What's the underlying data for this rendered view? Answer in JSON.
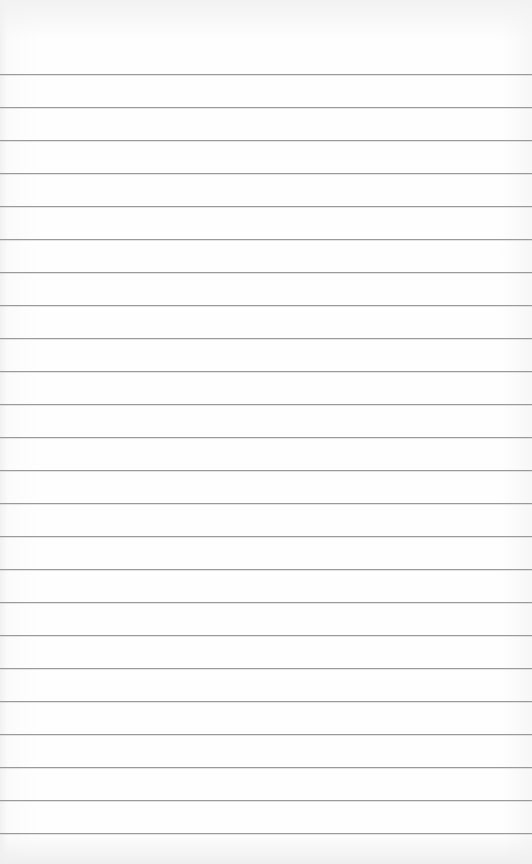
{
  "paper": {
    "type": "lined-paper",
    "background_color": "#fdfdfd",
    "line_color": "#9a9a9a",
    "line_count": 24,
    "first_line_y": 74,
    "line_spacing": 33
  }
}
